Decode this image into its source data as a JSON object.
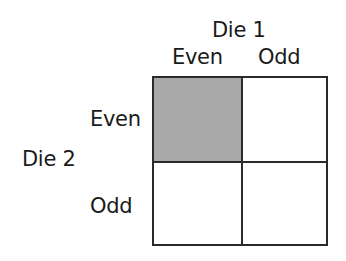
{
  "diagram": {
    "column_variable": "Die 1",
    "row_variable": "Die 2",
    "column_labels": [
      "Even",
      "Odd"
    ],
    "row_labels": [
      "Even",
      "Odd"
    ],
    "cells": [
      {
        "row": "Even",
        "col": "Even",
        "shaded": true
      },
      {
        "row": "Even",
        "col": "Odd",
        "shaded": false
      },
      {
        "row": "Odd",
        "col": "Even",
        "shaded": false
      },
      {
        "row": "Odd",
        "col": "Odd",
        "shaded": false
      }
    ],
    "colors": {
      "shaded": "#a9a9a9",
      "border": "#2a2a2a",
      "background": "#ffffff"
    }
  }
}
